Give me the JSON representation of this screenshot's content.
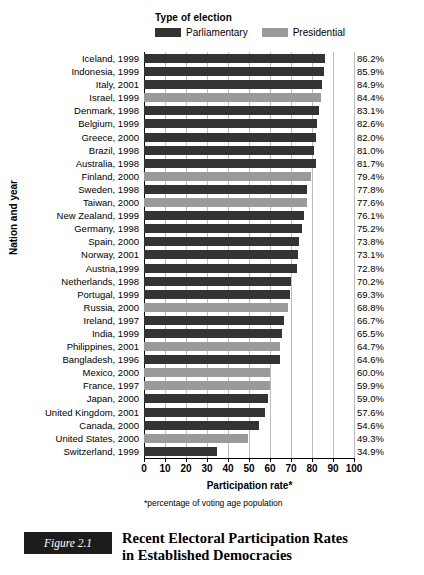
{
  "legend": {
    "title": "Type of election",
    "entries": [
      {
        "label": "Parliamentary",
        "color": "#333333"
      },
      {
        "label": "Presidential",
        "color": "#9a9a9a"
      }
    ]
  },
  "axes": {
    "y_title": "Nation and year",
    "x_title": "Participation rate*",
    "footnote": "*percentage of voting age population",
    "x_ticks": [
      "0",
      "10",
      "20",
      "30",
      "40",
      "50",
      "60",
      "70",
      "80",
      "90",
      "100"
    ]
  },
  "caption": {
    "figure_number": "Figure 2.1",
    "line1": "Recent Electoral Participation Rates",
    "line2": "in Established Democracies"
  },
  "chart_data": {
    "type": "bar",
    "orientation": "horizontal",
    "title": "Recent Electoral Participation Rates in Established Democracies",
    "xlabel": "Participation rate*",
    "ylabel": "Nation and year",
    "xlim": [
      0,
      100
    ],
    "grid": true,
    "legend_position": "top",
    "note": "*percentage of voting age population",
    "series_names": [
      "Parliamentary",
      "Presidential"
    ],
    "categories": [
      "Iceland, 1999",
      "Indonesia, 1999",
      "Italy, 2001",
      "Israel, 1999",
      "Denmark, 1998",
      "Belgium, 1999",
      "Greece, 2000",
      "Brazil, 1998",
      "Australia, 1998",
      "Finland, 2000",
      "Sweden, 1998",
      "Taiwan, 2000",
      "New Zealand, 1999",
      "Germany, 1998",
      "Spain, 2000",
      "Norway, 2001",
      "Austria,1999",
      "Netherlands, 1998",
      "Portugal, 1999",
      "Russia, 2000",
      "Ireland, 1997",
      "India, 1999",
      "Philippines, 2001",
      "Bangladesh, 1996",
      "Mexico, 2000",
      "France, 1997",
      "Japan, 2000",
      "United Kingdom, 2001",
      "Canada, 2000",
      "United States, 2000",
      "Switzerland, 1999"
    ],
    "values": [
      86.2,
      85.9,
      84.9,
      84.4,
      83.1,
      82.6,
      82.0,
      81.0,
      81.7,
      79.4,
      77.8,
      77.6,
      76.1,
      75.2,
      73.8,
      73.1,
      72.8,
      70.2,
      69.3,
      68.8,
      66.7,
      65.5,
      64.7,
      64.6,
      60.0,
      59.9,
      59.0,
      57.6,
      54.6,
      49.3,
      34.9
    ],
    "value_labels": [
      "86.2%",
      "85.9%",
      "84.9%",
      "84.4%",
      "83.1%",
      "82.6%",
      "82.0%",
      "81.0%",
      "81.7%",
      "79.4%",
      "77.8%",
      "77.6%",
      "76.1%",
      "75.2%",
      "73.8%",
      "73.1%",
      "72.8%",
      "70.2%",
      "69.3%",
      "68.8%",
      "66.7%",
      "65.5%",
      "64.7%",
      "64.6%",
      "60.0%",
      "59.9%",
      "59.0%",
      "57.6%",
      "54.6%",
      "49.3%",
      "34.9%"
    ],
    "election_type": [
      "Parliamentary",
      "Parliamentary",
      "Parliamentary",
      "Presidential",
      "Parliamentary",
      "Parliamentary",
      "Parliamentary",
      "Parliamentary",
      "Parliamentary",
      "Presidential",
      "Parliamentary",
      "Presidential",
      "Parliamentary",
      "Parliamentary",
      "Parliamentary",
      "Parliamentary",
      "Parliamentary",
      "Parliamentary",
      "Parliamentary",
      "Presidential",
      "Parliamentary",
      "Parliamentary",
      "Presidential",
      "Parliamentary",
      "Presidential",
      "Presidential",
      "Parliamentary",
      "Parliamentary",
      "Parliamentary",
      "Presidential",
      "Parliamentary"
    ]
  }
}
